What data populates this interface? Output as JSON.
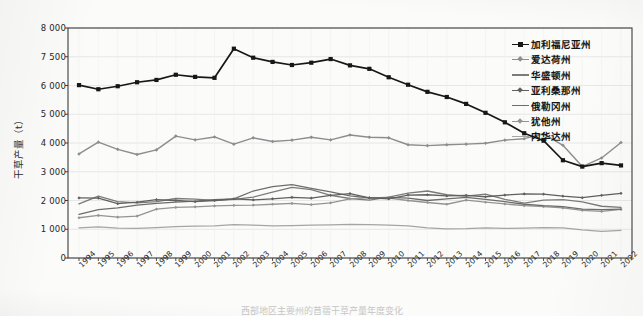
{
  "figure": {
    "caption": "西部地区主要州的苜蓿干草产量年度变化",
    "background_color": "#fbfbfa",
    "plot_background_color": "#fbfbfa",
    "frame_color": "#3d3d3d",
    "grid_color": "#e2e2e2"
  },
  "chart_data": {
    "type": "line",
    "title": "",
    "xlabel": "",
    "ylabel": "干草产量（t）",
    "grid": true,
    "legend_position": "top-right",
    "ylim": [
      0,
      8000
    ],
    "yticks": [
      0,
      1000,
      2000,
      3000,
      4000,
      5000,
      6000,
      7500,
      8000
    ],
    "ytick_labels": [
      "0",
      "1 000",
      "2 000",
      "3 000",
      "4 000",
      "5 000",
      "6 000",
      "7 500",
      "8 000"
    ],
    "categories": [
      "1994",
      "1995",
      "1996",
      "1997",
      "1998",
      "1999",
      "2000",
      "2001",
      "2002",
      "2003",
      "2004",
      "2005",
      "2006",
      "2007",
      "2008",
      "2009",
      "2010",
      "2011",
      "2012",
      "2013",
      "2014",
      "2015",
      "2016",
      "2017",
      "2018",
      "2019",
      "2020",
      "2021",
      "2022"
    ],
    "series": [
      {
        "name": "加利福尼亚州",
        "color": "#171717",
        "marker": "square",
        "marker_size": 4.2,
        "line_width": 1.7,
        "values": [
          6020,
          5870,
          5975,
          6170,
          6290,
          6560,
          6450,
          6400,
          7640,
          7450,
          7230,
          7070,
          7190,
          7380,
          7050,
          6870,
          6430,
          6040,
          5780,
          5600,
          5360,
          5050,
          4720,
          4340,
          4080,
          3400,
          3180,
          3300,
          3220
        ]
      },
      {
        "name": "爱达荷州",
        "color": "#8d8d8d",
        "marker": "diamond",
        "marker_size": 3.6,
        "line_width": 1.4,
        "values": [
          3620,
          4030,
          3780,
          3600,
          3760,
          4240,
          4110,
          4210,
          3960,
          4180,
          4050,
          4100,
          4200,
          4110,
          4280,
          4200,
          4180,
          3940,
          3910,
          3940,
          3960,
          3990,
          4100,
          4150,
          4320,
          3920,
          3180,
          3480,
          4020
        ]
      },
      {
        "name": "华盛顿州",
        "color": "#7b7b7b",
        "marker": "none",
        "marker_size": 0,
        "line_width": 1.3,
        "values": [
          1880,
          2150,
          1960,
          1920,
          1960,
          2070,
          2050,
          2000,
          2040,
          2120,
          2290,
          2460,
          2380,
          2180,
          2070,
          2010,
          2120,
          2260,
          2330,
          2200,
          2150,
          2220,
          2040,
          1910,
          2010,
          2030,
          1950,
          1800,
          1760
        ]
      },
      {
        "name": "亚利桑那州",
        "color": "#606060",
        "marker": "diamond",
        "marker_size": 3.2,
        "line_width": 1.3,
        "values": [
          2090,
          2080,
          1890,
          1940,
          2030,
          2000,
          1960,
          2000,
          2060,
          2020,
          2060,
          2110,
          2080,
          2180,
          2240,
          2090,
          2060,
          2190,
          2200,
          2160,
          2180,
          2130,
          2190,
          2230,
          2220,
          2150,
          2100,
          2180,
          2250
        ]
      },
      {
        "name": "俄勒冈州",
        "color": "#6d6d6d",
        "marker": "none",
        "marker_size": 0,
        "line_width": 1.3,
        "values": [
          1520,
          1680,
          1740,
          1840,
          1900,
          1940,
          1980,
          2030,
          2060,
          2330,
          2480,
          2550,
          2420,
          2300,
          2160,
          2090,
          2110,
          2080,
          2000,
          2060,
          2110,
          2040,
          1960,
          1870,
          1820,
          1790,
          1700,
          1680,
          1700
        ]
      },
      {
        "name": "犹他州",
        "color": "#949494",
        "marker": "diamond",
        "marker_size": 3.2,
        "line_width": 1.3,
        "values": [
          1400,
          1480,
          1420,
          1460,
          1700,
          1760,
          1780,
          1810,
          1830,
          1840,
          1870,
          1900,
          1860,
          1920,
          2060,
          2100,
          2080,
          2000,
          1930,
          1870,
          2010,
          1940,
          1880,
          1820,
          1790,
          1740,
          1660,
          1620,
          1690
        ]
      },
      {
        "name": "内华达州",
        "color": "#a5a5a5",
        "marker": "none",
        "marker_size": 0,
        "line_width": 1.25,
        "values": [
          1050,
          1080,
          1040,
          1030,
          1060,
          1090,
          1110,
          1120,
          1160,
          1140,
          1120,
          1130,
          1140,
          1150,
          1170,
          1160,
          1140,
          1120,
          1050,
          1010,
          1020,
          1050,
          1030,
          1040,
          1060,
          1050,
          980,
          930,
          960
        ]
      }
    ]
  }
}
